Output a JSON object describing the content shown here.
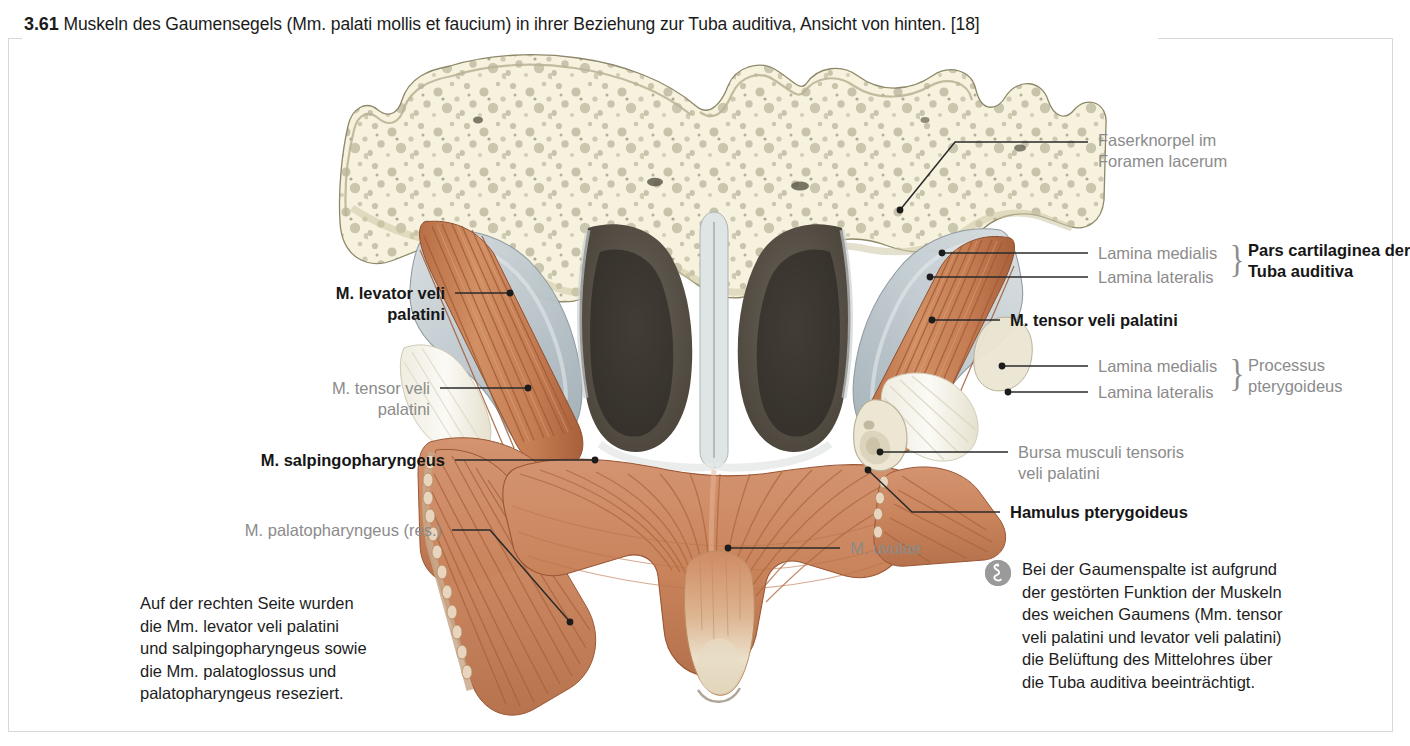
{
  "figure": {
    "number": "3.61",
    "caption": "Muskeln des Gaumensegels (Mm. palati mollis et faucium) in ihrer Beziehung zur Tuba auditiva, Ansicht von hinten. [18]"
  },
  "labels": {
    "faserknorpel": "Faserknorpel im\nForamen lacerum",
    "lamina_medialis_tuba": "Lamina medialis",
    "lamina_lateralis_tuba": "Lamina lateralis",
    "pars_cartilaginea": "Pars cartilaginea der\nTuba auditiva",
    "tensor_right": "M. tensor veli palatini",
    "lamina_medialis_proc": "Lamina medialis",
    "lamina_lateralis_proc": "Lamina lateralis",
    "processus_pterygoideus": "Processus\npterygoideus",
    "bursa": "Bursa musculi tensoris\nveli palatini",
    "hamulus": "Hamulus pterygoideus",
    "levator": "M. levator veli\npalatini",
    "tensor_left": "M. tensor veli\npalatini",
    "salpingopharyngeus": "M. salpingopharyngeus",
    "palatopharyngeus": "M. palatopharyngeus (res.)",
    "uvulae": "M. uvulae",
    "brace_symbol": "}"
  },
  "notes": {
    "resection": "Auf der rechten Seite wurden\ndie Mm. levator veli palatini\nund salpingopharyngeus sowie\ndie Mm.  palatoglossus und\npalatopharyngeus reseziert.",
    "clinical": "Bei der Gaumenspalte ist aufgrund\nder gestörten Funktion der Muskeln\ndes weichen Gaumens (Mm. tensor\nveli palatini und levator veli palatini)\ndie Belüftung des Mittelohres über\ndie Tuba auditiva beeinträchtigt."
  },
  "colors": {
    "bone": "#f3efd8",
    "bone_shadow": "#ddd6b4",
    "cartilage": "#c3ccd0",
    "muscle": "#cf845c",
    "muscle_dark": "#a35f3c",
    "choana": "#3a3630",
    "tendon": "#f4f2ea",
    "leader": "#2a2a2a",
    "label_gray": "#8b8b8b",
    "label_black": "#161616",
    "frame": "#d8d8d8",
    "clinical_icon": "#9a9a9a"
  }
}
